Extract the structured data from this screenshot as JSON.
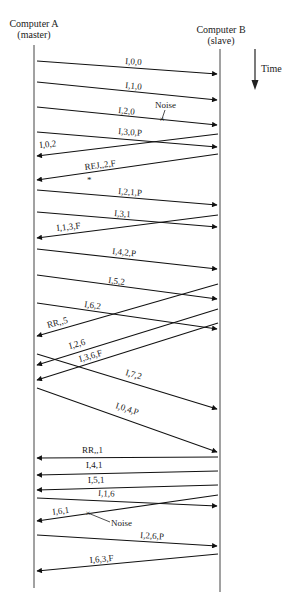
{
  "header": {
    "left_title": "Computer A",
    "left_subtitle": "(master)",
    "right_title": "Computer B",
    "right_subtitle": "(slave)",
    "time_label": "Time"
  },
  "colors": {
    "line": "#111111",
    "lifeline": "#444444",
    "background": "#ffffff"
  },
  "lifelines": {
    "left_x": 34,
    "right_x": 220,
    "top_y": 45,
    "left_bottom_y": 588,
    "right_bottom_y": 592
  },
  "messages": [
    {
      "label": "I,0,0",
      "dir": "AtoB",
      "y1": 61,
      "y2": 74,
      "lx": 125,
      "ly": 64,
      "rot": 4
    },
    {
      "label": "I,1,0",
      "dir": "AtoB",
      "y1": 82,
      "y2": 100,
      "lx": 125,
      "ly": 88,
      "rot": 5.5
    },
    {
      "label": "I,2,0",
      "dir": "AtoB",
      "y1": 107,
      "y2": 125,
      "lx": 118,
      "ly": 113,
      "rot": 5.5
    },
    {
      "label": "I,3,0,P",
      "dir": "AtoB",
      "y1": 132,
      "y2": 147,
      "lx": 118,
      "ly": 134,
      "rot": 4.5
    },
    {
      "label": "I,0,2",
      "dir": "BtoA",
      "y1": 134,
      "y2": 156,
      "lx": 40,
      "ly": 148,
      "rot": -6.5
    },
    {
      "label": "REJ,,2,F",
      "dir": "BtoA",
      "y1": 154,
      "y2": 180,
      "lx": 85,
      "ly": 170,
      "rot": -7.5
    },
    {
      "label": "I,2,1,P",
      "dir": "AtoB",
      "y1": 190,
      "y2": 205,
      "lx": 118,
      "ly": 194,
      "rot": 4.5
    },
    {
      "label": "I,3,1",
      "dir": "AtoB",
      "y1": 212,
      "y2": 227,
      "lx": 114,
      "ly": 216,
      "rot": 4.5
    },
    {
      "label": "I,1,3,F",
      "dir": "BtoA",
      "y1": 215,
      "y2": 238,
      "lx": 57,
      "ly": 231,
      "rot": -6.5
    },
    {
      "label": "I,4,2,P",
      "dir": "AtoB",
      "y1": 249,
      "y2": 269,
      "lx": 112,
      "ly": 254,
      "rot": 6
    },
    {
      "label": "I,5,2",
      "dir": "AtoB",
      "y1": 275,
      "y2": 299,
      "lx": 108,
      "ly": 283,
      "rot": 7
    },
    {
      "label": "I,6,2",
      "dir": "AtoB",
      "y1": 303,
      "y2": 329,
      "lx": 84,
      "ly": 307,
      "rot": 8
    },
    {
      "label": "RR,,5",
      "dir": "BtoA",
      "y1": 284,
      "y2": 336,
      "lx": 48,
      "ly": 328,
      "rot": -15
    },
    {
      "label": "I,2,6",
      "dir": "BtoA",
      "y1": 309,
      "y2": 365,
      "lx": 70,
      "ly": 349,
      "rot": -16
    },
    {
      "label": "I,3,6,F",
      "dir": "BtoA",
      "y1": 323,
      "y2": 380,
      "lx": 80,
      "ly": 362,
      "rot": -16
    },
    {
      "label": "I,7,2",
      "dir": "AtoB",
      "y1": 354,
      "y2": 409,
      "lx": 125,
      "ly": 375,
      "rot": 16
    },
    {
      "label": "I,0,4,P",
      "dir": "AtoB",
      "y1": 388,
      "y2": 452,
      "lx": 115,
      "ly": 408,
      "rot": 18
    },
    {
      "label": "RR,,1",
      "dir": "BtoA",
      "y1": 457,
      "y2": 458,
      "lx": 82,
      "ly": 453,
      "rot": 0
    },
    {
      "label": "I,4,1",
      "dir": "BtoA",
      "y1": 471,
      "y2": 475,
      "lx": 86,
      "ly": 468,
      "rot": -1
    },
    {
      "label": "I,5,1",
      "dir": "BtoA",
      "y1": 485,
      "y2": 490,
      "lx": 88,
      "ly": 483,
      "rot": -1.5
    },
    {
      "label": "I,1,6",
      "dir": "AtoB",
      "y1": 498,
      "y2": 506,
      "lx": 98,
      "ly": 496,
      "rot": 2.5
    },
    {
      "label": "I,6,1",
      "dir": "BtoA",
      "y1": 495,
      "y2": 521,
      "lx": 53,
      "ly": 515,
      "rot": -8
    },
    {
      "label": "I,2,6,P",
      "dir": "AtoB",
      "y1": 535,
      "y2": 546,
      "lx": 140,
      "ly": 538,
      "rot": 3.5
    },
    {
      "label": "I,6,3,F",
      "dir": "BtoA",
      "y1": 554,
      "y2": 571,
      "lx": 90,
      "ly": 563,
      "rot": -5
    }
  ],
  "annotations": [
    {
      "id": "noise-1",
      "label": "Noise",
      "text_x": 155,
      "text_y": 108,
      "mark_x": 162,
      "mark_y": 119,
      "line_from_x": 165,
      "line_from_y": 110
    },
    {
      "id": "noise-2",
      "label": "Noise",
      "text_x": 111,
      "text_y": 526,
      "mark_x": 88,
      "mark_y": 513,
      "line_from_x": 110,
      "line_from_y": 522
    },
    {
      "id": "asterisk",
      "label": "*",
      "x": 87,
      "y": 183
    }
  ]
}
